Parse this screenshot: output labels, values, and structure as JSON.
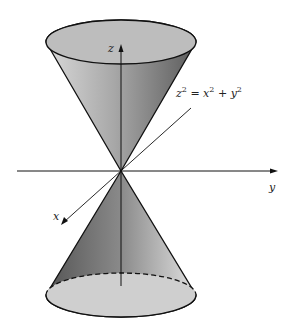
{
  "diagram": {
    "equation": {
      "lhs": "z",
      "lhs_exp": "2",
      "eq": " = ",
      "x": "x",
      "x_exp": "2",
      "plus": " + ",
      "y": "y",
      "y_exp": "2"
    },
    "axes": {
      "x": "x",
      "y": "y",
      "z": "z"
    },
    "colors": {
      "stroke": "#111111",
      "fill_light": "#d6d6d6",
      "fill_dark": "#6a6a6a"
    }
  }
}
